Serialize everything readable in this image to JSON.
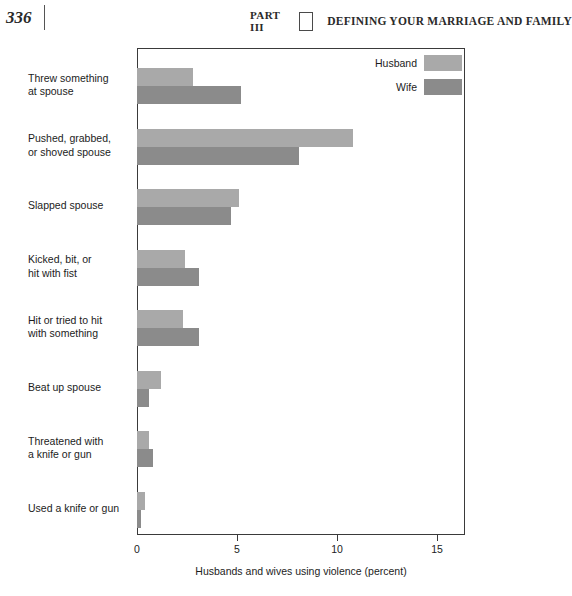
{
  "header": {
    "folio": "336",
    "part_label": "PART III",
    "title": "DEFINING YOUR MARRIAGE AND FAMILY"
  },
  "colors": {
    "husband": "#a9a9a9",
    "wife": "#8b8b8b",
    "axis": "#3a3a3a"
  },
  "chart_data": {
    "type": "bar",
    "orientation": "horizontal",
    "title": "",
    "xlabel": "Husbands and wives using violence (percent)",
    "ylabel": "",
    "xlim": [
      0,
      16.4
    ],
    "xticks": [
      0,
      5,
      10,
      15
    ],
    "xtick_labels": [
      "0",
      "5",
      "10",
      "15"
    ],
    "grid": false,
    "legend_position": "top-right",
    "categories": [
      "Threw something at spouse",
      "Pushed, grabbed, or shoved spouse",
      "Slapped spouse",
      "Kicked, bit, or hit with fist",
      "Hit or tried to hit with something",
      "Beat up spouse",
      "Threatened with a knife or gun",
      "Used a knife or gun"
    ],
    "category_lines": [
      [
        "Threw something",
        "at spouse"
      ],
      [
        "Pushed, grabbed,",
        "or shoved spouse"
      ],
      [
        "Slapped spouse"
      ],
      [
        "Kicked, bit, or",
        "hit with fist"
      ],
      [
        "Hit or tried to hit",
        "with something"
      ],
      [
        "Beat up spouse"
      ],
      [
        "Threatened with",
        "a knife or gun"
      ],
      [
        "Used a knife or gun"
      ]
    ],
    "series": [
      {
        "name": "Husband",
        "color": "#a9a9a9",
        "values": [
          2.8,
          10.8,
          5.1,
          2.4,
          2.3,
          1.2,
          0.6,
          0.4
        ]
      },
      {
        "name": "Wife",
        "color": "#8b8b8b",
        "values": [
          5.2,
          8.1,
          4.7,
          3.1,
          3.1,
          0.6,
          0.8,
          0.2
        ]
      }
    ]
  }
}
